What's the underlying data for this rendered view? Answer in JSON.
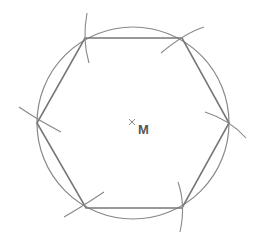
{
  "diagram": {
    "center_label": "M",
    "center_marker": "×",
    "colors": {
      "stroke": "#777777",
      "text": "#555555"
    }
  }
}
